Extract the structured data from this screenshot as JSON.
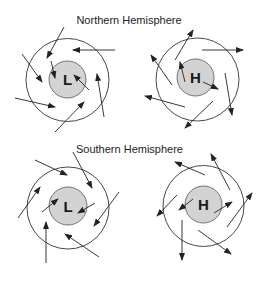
{
  "diagram": {
    "northern_title": "Northern Hemisphere",
    "southern_title": "Southern Hemisphere",
    "colors": {
      "background": "#ffffff",
      "outer_circle": "#333333",
      "inner_fill": "#d3d3d3",
      "arrow": "#222222"
    },
    "panels": [
      {
        "id": "north-low",
        "hemisphere": "Northern",
        "label": "L",
        "outer": {
          "cx": 67.5,
          "cy": 80,
          "r": 41.5
        },
        "inner": {
          "cx": 67.5,
          "cy": 79.5,
          "r": 18.5
        },
        "label_pos": {
          "x": 67.5,
          "y": 85
        },
        "arrows": [
          [
            64,
            27,
            47,
            58
          ],
          [
            22,
            54,
            42,
            82
          ],
          [
            51,
            61,
            55,
            78
          ],
          [
            115,
            50,
            73,
            50
          ],
          [
            89,
            90,
            74,
            75
          ],
          [
            104,
            117,
            97,
            74
          ],
          [
            55,
            132,
            84,
            102
          ],
          [
            15,
            98,
            55,
            107
          ]
        ]
      },
      {
        "id": "north-high",
        "hemisphere": "Northern",
        "label": "H",
        "outer": {
          "cx": 197.5,
          "cy": 79.5,
          "r": 41.5
        },
        "inner": {
          "cx": 195.5,
          "cy": 77.5,
          "r": 18.5
        },
        "label_pos": {
          "x": 195.5,
          "y": 83
        },
        "arrows": [
          [
            175,
            60,
            193,
            30
          ],
          [
            172,
            85,
            151,
            55
          ],
          [
            185,
            82,
            180,
            62
          ],
          [
            185,
            107,
            145,
            96
          ],
          [
            202,
            50,
            243,
            50
          ],
          [
            203,
            82,
            218,
            89
          ],
          [
            225,
            73,
            232,
            115
          ],
          [
            213,
            101,
            185,
            128
          ]
        ]
      },
      {
        "id": "south-low",
        "hemisphere": "Southern",
        "label": "L",
        "outer": {
          "cx": 68,
          "cy": 208,
          "r": 41
        },
        "inner": {
          "cx": 68,
          "cy": 206,
          "r": 19
        },
        "label_pos": {
          "x": 68,
          "y": 211.5
        },
        "arrows": [
          [
            35,
            160,
            67,
            175
          ],
          [
            18,
            218,
            40,
            187
          ],
          [
            42,
            212,
            58,
            199
          ],
          [
            46,
            263,
            46,
            222
          ],
          [
            73,
            152,
            92,
            188
          ],
          [
            95,
            203,
            78,
            213
          ],
          [
            119,
            192,
            94,
            226
          ],
          [
            99,
            257,
            65,
            234
          ]
        ]
      },
      {
        "id": "south-high",
        "hemisphere": "Southern",
        "label": "H",
        "outer": {
          "cx": 203.5,
          "cy": 206,
          "r": 40.5
        },
        "inner": {
          "cx": 203.5,
          "cy": 204.5,
          "r": 18.5
        },
        "label_pos": {
          "x": 203.5,
          "y": 210
        },
        "arrows": [
          [
            205,
            175,
            175,
            162
          ],
          [
            177,
            195,
            157,
            216
          ],
          [
            193,
            199,
            179,
            210
          ],
          [
            182,
            220,
            182,
            260
          ],
          [
            230,
            190,
            211,
            154
          ],
          [
            214,
            213,
            232,
            202
          ],
          [
            227,
            227,
            252,
            193
          ],
          [
            198,
            230,
            231,
            254
          ]
        ]
      }
    ]
  }
}
